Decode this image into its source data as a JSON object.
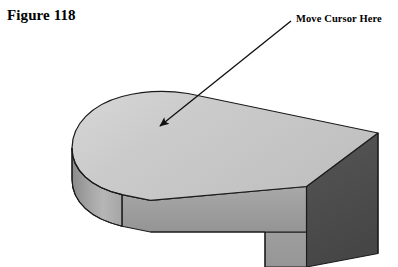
{
  "figure": {
    "label": "Figure 118"
  },
  "annotation": {
    "label": "Move Cursor Here",
    "arrow": {
      "tail_x": 291,
      "tail_y": 21,
      "tip_x": 156,
      "tip_y": 129
    }
  },
  "illustration": {
    "title": "Isometric 3D solid model with rounded end",
    "description": "Shaded CAD-style L-shaped slab viewed in isometric projection; semicircular rounded left end, flat top face, front side wall, dark right end face.",
    "colors": {
      "top_face": "#c9c9c9",
      "top_face_highlight": "#d6d6d6",
      "front_face": "#9e9e9e",
      "front_face_light": "#ababab",
      "curved_face_light": "#b4b4b4",
      "curved_face_dark": "#8d8d8d",
      "right_end_face": "#4c4c4c",
      "lower_front_face": "#9a9a9a",
      "outline": "#1a1a1a",
      "seam_line": "#2b2b2b",
      "background": "#ffffff"
    },
    "geometry": {
      "top_face_path": "M 72 120 C 72 98 90 82 116 76 C 140 71 170 72 190 76 L 378 133 L 306 186 L 150 200 L 116 193 C 90 187 72 170 72 148 Z",
      "front_face_path": "M 72 148 C 72 170 90 187 116 193 L 150 200 L 306 186 L 306 232 L 150 232 L 116 225 C 90 219 72 202 72 180 Z",
      "right_end_face_path": "M 306 186 L 378 133 L 378 253 L 306 267 Z",
      "lower_leg_path": "M 265 232 L 306 232 L 306 267 L 265 267 Z",
      "tangent_seam": {
        "x1": 122,
        "y1": 194,
        "x2": 122,
        "y2": 226
      }
    }
  }
}
